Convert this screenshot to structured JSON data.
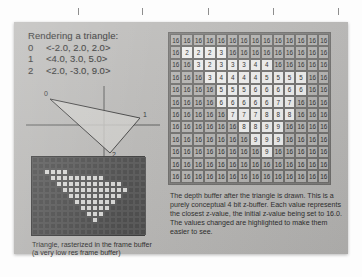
{
  "slide": {
    "title": "Rendering a triangle:",
    "vertices": [
      {
        "index": "0",
        "value": "<-2.0, 2.0, 2.0>"
      },
      {
        "index": "1",
        "value": "<4.0, 3.0, 5.0>"
      },
      {
        "index": "2",
        "value": "<2.0, -3.0, 9.0>"
      }
    ],
    "diagram": {
      "vertex_labels": [
        "0",
        "1",
        "2"
      ],
      "origin_label": "|"
    },
    "framebuffer_caption": "Triangle, rasterized in the frame buffer (a very low res frame buffer)",
    "zbuffer_caption": "The depth buffer after the triangle is drawn. This is a purely conceptual 4 bit z-buffer. Each value represents the closest z-value, the initial z-value being set to 16.0.  The values changed are highlighted to make them easier to see."
  },
  "colors": {
    "slide_background": "#b9b8b6",
    "paper": "#fdfdfd",
    "text": "#2a2a2a",
    "framebuffer_off": "#4a4a4a",
    "framebuffer_on": "#d8d8d6",
    "zcell_default": "#b3b2b0",
    "zcell_changed": "#efefee",
    "grid_line": "#6e6d6b"
  },
  "chart_data": {
    "type": "heatmap",
    "title": "Depth buffer after the triangle is drawn",
    "xlabel": "",
    "ylabel": "",
    "columns": 14,
    "rows": 12,
    "initial_value": 16,
    "bit_depth": 4,
    "legend": [
      {
        "label": "unchanged (initial z = 16)",
        "color": "#b3b2b0"
      },
      {
        "label": "changed (written by triangle)",
        "color": "#efefee"
      }
    ],
    "values": [
      [
        16,
        16,
        16,
        16,
        16,
        16,
        16,
        16,
        16,
        16,
        16,
        16,
        16,
        16
      ],
      [
        16,
        2,
        2,
        2,
        3,
        16,
        16,
        16,
        16,
        16,
        16,
        16,
        16,
        16
      ],
      [
        16,
        16,
        3,
        2,
        3,
        3,
        3,
        4,
        4,
        16,
        16,
        16,
        16,
        16
      ],
      [
        16,
        16,
        16,
        3,
        4,
        4,
        4,
        4,
        5,
        5,
        5,
        5,
        16,
        16
      ],
      [
        16,
        16,
        16,
        16,
        5,
        5,
        5,
        6,
        6,
        6,
        6,
        6,
        16,
        16
      ],
      [
        16,
        16,
        16,
        16,
        6,
        6,
        6,
        6,
        6,
        7,
        7,
        16,
        16,
        16
      ],
      [
        16,
        16,
        16,
        16,
        16,
        7,
        7,
        7,
        8,
        8,
        8,
        16,
        16,
        16
      ],
      [
        16,
        16,
        16,
        16,
        16,
        16,
        8,
        8,
        9,
        9,
        16,
        16,
        16,
        16
      ],
      [
        16,
        16,
        16,
        16,
        16,
        16,
        16,
        9,
        9,
        9,
        16,
        16,
        16,
        16
      ],
      [
        16,
        16,
        16,
        16,
        16,
        16,
        16,
        16,
        9,
        16,
        16,
        16,
        16,
        16
      ],
      [
        16,
        16,
        16,
        16,
        16,
        16,
        16,
        16,
        16,
        16,
        16,
        16,
        16,
        16
      ],
      [
        16,
        16,
        16,
        16,
        16,
        16,
        16,
        16,
        16,
        16,
        16,
        16,
        16,
        16
      ]
    ],
    "framebuffer": {
      "type": "heatmap",
      "columns": 19,
      "rows": 13,
      "legend": [
        {
          "label": "background",
          "color": "#4a4a4a"
        },
        {
          "label": "triangle",
          "color": "#d8d8d6"
        }
      ],
      "pixels": [
        [
          0,
          0,
          0,
          0,
          0,
          0,
          0,
          0,
          0,
          0,
          0,
          0,
          0,
          0,
          0,
          0,
          0,
          0,
          0
        ],
        [
          0,
          0,
          0,
          0,
          0,
          0,
          0,
          0,
          0,
          0,
          0,
          0,
          0,
          0,
          0,
          0,
          0,
          0,
          0
        ],
        [
          0,
          0,
          1,
          1,
          1,
          1,
          0,
          0,
          0,
          0,
          0,
          0,
          0,
          0,
          0,
          0,
          0,
          0,
          0
        ],
        [
          0,
          0,
          0,
          1,
          1,
          1,
          1,
          1,
          1,
          1,
          1,
          1,
          0,
          0,
          0,
          0,
          0,
          0,
          0
        ],
        [
          0,
          0,
          0,
          0,
          1,
          1,
          1,
          1,
          1,
          1,
          1,
          1,
          1,
          1,
          1,
          0,
          0,
          0,
          0
        ],
        [
          0,
          0,
          0,
          0,
          0,
          1,
          1,
          1,
          1,
          1,
          1,
          1,
          1,
          1,
          1,
          1,
          0,
          0,
          0
        ],
        [
          0,
          0,
          0,
          0,
          0,
          0,
          1,
          1,
          1,
          1,
          1,
          1,
          1,
          1,
          1,
          0,
          0,
          0,
          0
        ],
        [
          0,
          0,
          0,
          0,
          0,
          0,
          0,
          1,
          1,
          1,
          1,
          1,
          1,
          1,
          0,
          0,
          0,
          0,
          0
        ],
        [
          0,
          0,
          0,
          0,
          0,
          0,
          0,
          0,
          1,
          1,
          1,
          1,
          1,
          0,
          0,
          0,
          0,
          0,
          0
        ],
        [
          0,
          0,
          0,
          0,
          0,
          0,
          0,
          0,
          0,
          1,
          1,
          1,
          0,
          0,
          0,
          0,
          0,
          0,
          0
        ],
        [
          0,
          0,
          0,
          0,
          0,
          0,
          0,
          0,
          0,
          0,
          1,
          0,
          0,
          0,
          0,
          0,
          0,
          0,
          0
        ],
        [
          0,
          0,
          0,
          0,
          0,
          0,
          0,
          0,
          0,
          0,
          0,
          0,
          0,
          0,
          0,
          0,
          0,
          0,
          0
        ],
        [
          0,
          0,
          0,
          0,
          0,
          0,
          0,
          0,
          0,
          0,
          0,
          0,
          0,
          0,
          0,
          0,
          0,
          0,
          0
        ]
      ]
    }
  }
}
